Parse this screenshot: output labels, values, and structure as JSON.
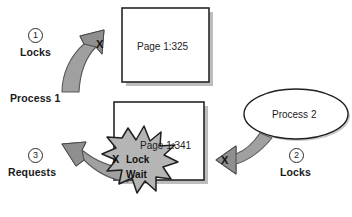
{
  "diagram": {
    "colors": {
      "arrow_fill": "#a8a8a8",
      "arrow_stroke": "#4f4f4f",
      "burst_fill": "#b5b5b5",
      "burst_stroke": "#1f1f1f",
      "box_stroke": "#262626",
      "box_fill": "#ffffff",
      "shadow": "#b9b9b9",
      "text": "#1a1a1a"
    },
    "pages": [
      {
        "name": "page-box-325",
        "label": "Page 1:325"
      },
      {
        "name": "page-box-341",
        "label": "Page 1:341"
      }
    ],
    "processes": [
      {
        "name": "process-1",
        "label": "Process 1",
        "shape": "text"
      },
      {
        "name": "process-2",
        "label": "Process 2",
        "shape": "ellipse"
      }
    ],
    "steps": [
      {
        "number": "1",
        "label": "Locks"
      },
      {
        "number": "2",
        "label": "Locks"
      },
      {
        "number": "3",
        "label": "Requests"
      }
    ],
    "burst": {
      "line1": "Lock",
      "line2": "Wait"
    },
    "arrow_marks": [
      {
        "name": "x-mark-top",
        "label": "X"
      },
      {
        "name": "x-mark-bottom-left",
        "label": "X"
      },
      {
        "name": "x-mark-right",
        "label": "X"
      }
    ]
  }
}
